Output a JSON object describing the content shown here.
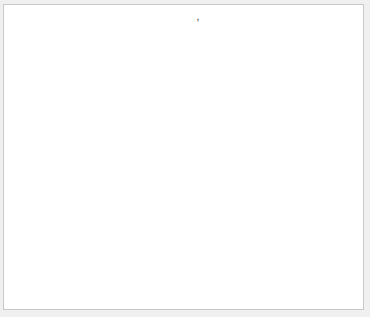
{
  "figure": {
    "title_parts": {
      "prefix": "S831, Re=3240000, ",
      "alpha": "α",
      "geom_sub": "geom",
      "geom_val": "=6.4",
      "eff_sub": "eff",
      "eff_val": "=5",
      "deg": "o",
      "trip": ",Serrated tape trip, C",
      "cd_sub": "d",
      "cd_val": "=0.0052678"
    }
  },
  "chart_data": [
    {
      "type": "scatter",
      "title": "S831, Re=3240000, α_geom=6.4°, α_eff=5°, Serrated tape trip, C_d=0.0052678",
      "xlabel": "Y-Y_cl/c",
      "ylabel": "C_po",
      "xlim": [
        -0.208,
        0.21
      ],
      "ylim": [
        0.75,
        1.05
      ],
      "xticks": [
        -0.2,
        -0.15,
        -0.1,
        -0.05,
        0,
        0.05,
        0.1,
        0.15,
        0.2
      ],
      "xtick_labels": [
        "-0.2",
        "-0.15",
        "-0.1",
        "-0.05",
        "0",
        "0.05",
        "0.1",
        "0.15",
        "0.2"
      ],
      "yticks": [
        0.8,
        0.9,
        1.0
      ],
      "ytick_labels": [
        "0.8",
        "0.9",
        "1"
      ],
      "marker": "open-circle",
      "grid": false,
      "x": [
        -0.175,
        -0.168,
        -0.161,
        -0.154,
        -0.147,
        -0.14,
        -0.133,
        -0.126,
        -0.119,
        -0.112,
        -0.105,
        -0.098,
        -0.091,
        -0.084,
        -0.077,
        -0.07,
        -0.065,
        -0.06,
        -0.055,
        -0.05,
        -0.045,
        -0.04,
        -0.035,
        -0.03,
        -0.025,
        -0.02,
        -0.015,
        -0.01,
        -0.005,
        0.0,
        0.005,
        0.01,
        0.015,
        0.02,
        0.025,
        0.03,
        0.035,
        0.04,
        0.045,
        0.05,
        0.055,
        0.06,
        0.067,
        0.074,
        0.081,
        0.088,
        0.095,
        0.102,
        0.109,
        0.116,
        0.123,
        0.13,
        0.137,
        0.144,
        0.151,
        0.158,
        0.165,
        0.172,
        0.179,
        0.186,
        0.193,
        0.2,
        0.207
      ],
      "y": [
        1.01,
        1.01,
        1.01,
        1.01,
        1.01,
        1.01,
        1.01,
        1.01,
        1.01,
        1.01,
        1.01,
        1.01,
        1.01,
        1.01,
        1.008,
        1.005,
        1.003,
        0.998,
        0.99,
        0.98,
        0.97,
        0.962,
        0.955,
        0.947,
        0.94,
        0.932,
        0.926,
        0.921,
        0.918,
        0.918,
        0.921,
        0.926,
        0.932,
        0.94,
        0.947,
        0.955,
        0.963,
        0.972,
        0.985,
        0.998,
        1.003,
        1.005,
        1.006,
        1.006,
        1.007,
        1.007,
        1.008,
        1.008,
        1.008,
        1.007,
        1.006,
        1.006,
        1.005,
        1.005,
        1.007,
        1.011,
        1.011,
        1.011,
        1.011,
        1.01,
        1.01,
        1.011,
        1.011
      ]
    },
    {
      "type": "scatter",
      "title": "",
      "xlabel": "Y-Y_cl/c",
      "ylabel": "C_p",
      "xlim": [
        -0.208,
        0.21
      ],
      "ylim": [
        -0.5,
        0
      ],
      "xticks": [
        -0.2,
        -0.15,
        -0.1,
        -0.05,
        0,
        0.05,
        0.1,
        0.15,
        0.2
      ],
      "xtick_labels": [
        "-0.2",
        "-0.15",
        "-0.1",
        "-0.05",
        "0",
        "0.05",
        "0.1",
        "0.15",
        "0.2"
      ],
      "yticks": [
        -0.5,
        -0.4,
        -0.3,
        -0.2,
        -0.1,
        0
      ],
      "ytick_labels": [
        "-0.5",
        "-0.4",
        "-0.3",
        "-0.2",
        "-0.1",
        "0"
      ],
      "marker": "open-circle",
      "grid": false,
      "groups": [
        {
          "x_start": -0.175,
          "x_end": -0.093,
          "count": 15,
          "y": -0.13
        },
        {
          "x_start": -0.068,
          "x_end": 0.012,
          "count": 14,
          "y": -0.13
        },
        {
          "x_start": 0.045,
          "x_end": 0.125,
          "count": 14,
          "y": -0.13
        },
        {
          "x_start": 0.156,
          "x_end": 0.208,
          "count": 9,
          "y": -0.13
        }
      ],
      "line": {
        "x": [
          -0.07,
          0.048
        ],
        "y": [
          -0.125,
          -0.128
        ]
      }
    }
  ],
  "axes": {
    "top": {
      "ylabel_main": "C",
      "ylabel_sub": "po"
    },
    "bottom": {
      "ylabel_main": "C",
      "ylabel_sub": "p"
    },
    "xlabel_main": "Y-Y",
    "xlabel_sub": "cl",
    "xlabel_tail": "/c"
  },
  "colors": {
    "axis": "#262626",
    "marker": "#262626",
    "frame_border": "#c8c8c8",
    "outer_bg": "#f0f0f0"
  }
}
